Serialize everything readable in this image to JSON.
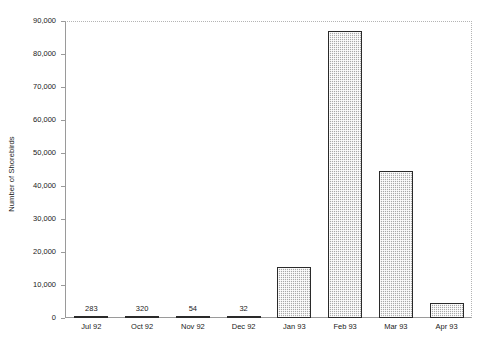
{
  "chart_data": {
    "type": "bar",
    "title": "",
    "xlabel": "",
    "ylabel": "Number of Shorebirds",
    "categories": [
      "Jul 92",
      "Oct 92",
      "Nov 92",
      "Dec 92",
      "Jan 93",
      "Feb 93",
      "Mar 93",
      "Apr 93"
    ],
    "values": [
      283,
      320,
      54,
      32,
      15500,
      87000,
      44500,
      4700
    ],
    "point_labels": [
      "283",
      "320",
      "54",
      "32",
      "",
      "",
      "",
      ""
    ],
    "ylim": [
      0,
      90000
    ],
    "yticks": [
      0,
      10000,
      20000,
      30000,
      40000,
      50000,
      60000,
      70000,
      80000,
      90000
    ],
    "ytick_labels": [
      "0",
      "10,000",
      "20,000",
      "30,000",
      "40,000",
      "50,000",
      "60,000",
      "70,000",
      "80,000",
      "90,000"
    ],
    "grid": false,
    "legend": "none",
    "bar_fill_color": "#a9a9a9",
    "bar_border_color": "#2a2a2a",
    "axis_color": "#9a9a9a",
    "text_color": "#1a1a1a",
    "background_color": "#ffffff"
  }
}
